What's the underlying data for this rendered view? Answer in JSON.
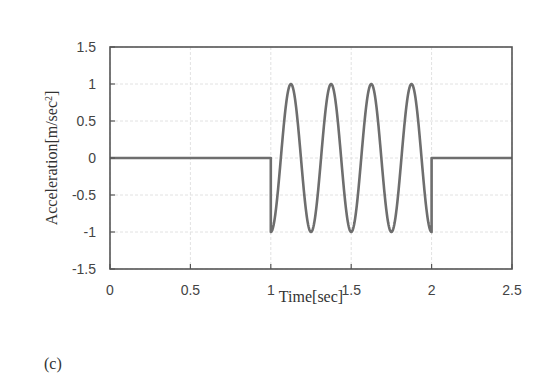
{
  "panel_label": "(c)",
  "chart_data": {
    "type": "line",
    "title": "",
    "xlabel": "Time[sec]",
    "ylabel": "Acceleration[m/sec2]",
    "ylabel_main": "Acceleration[m/sec",
    "ylabel_sup": "2",
    "ylabel_end": "]",
    "xlim": [
      0,
      2.5
    ],
    "ylim": [
      -1.5,
      1.5
    ],
    "xticks": [
      0,
      0.5,
      1,
      1.5,
      2,
      2.5
    ],
    "xtick_labels": [
      "0",
      "0.5",
      "1",
      "1.5",
      "2",
      "2.5"
    ],
    "yticks": [
      1.5,
      1,
      0.5,
      0,
      -0.5,
      -1,
      -1.5
    ],
    "ytick_labels": [
      "1.5",
      "1",
      "0.5",
      "0",
      "-0.5",
      "-1",
      "-1.5"
    ],
    "grid": true,
    "legend": null,
    "line_color": "#6e6e6e",
    "series": [
      {
        "name": "acceleration",
        "description": "0 for t<1 s; -cos(2*pi*4*(t-1)) for 1<=t<=2 s (4 cycles, amplitude 1, 4 Hz); 0 for t>2 s",
        "segments": [
          {
            "t_start": 0,
            "t_end": 1,
            "value": 0
          },
          {
            "t_start": 1,
            "t_end": 2,
            "function": "-cos(2*pi*4*(t-1))",
            "amplitude": 1,
            "frequency_hz": 4,
            "cycles": 4
          },
          {
            "t_start": 2,
            "t_end": 2.5,
            "value": 0
          }
        ],
        "key_points": [
          {
            "t": 0,
            "a": 0
          },
          {
            "t": 1,
            "a": 0
          },
          {
            "t": 1,
            "a": -1
          },
          {
            "t": 1.125,
            "a": 1
          },
          {
            "t": 1.25,
            "a": -1
          },
          {
            "t": 1.375,
            "a": 1
          },
          {
            "t": 1.5,
            "a": -1
          },
          {
            "t": 1.625,
            "a": 1
          },
          {
            "t": 1.75,
            "a": -1
          },
          {
            "t": 1.875,
            "a": 1
          },
          {
            "t": 2,
            "a": -1
          },
          {
            "t": 2,
            "a": 0
          },
          {
            "t": 2.5,
            "a": 0
          }
        ]
      }
    ]
  }
}
